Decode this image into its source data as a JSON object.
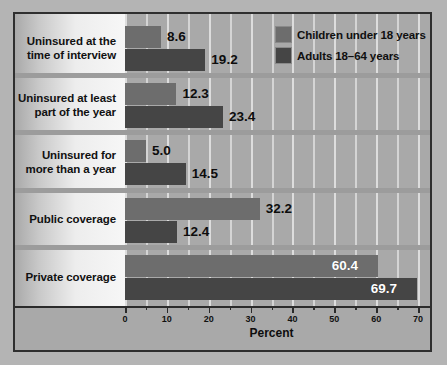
{
  "chart_data": {
    "type": "bar",
    "orientation": "horizontal",
    "title": "",
    "xlabel": "Percent",
    "ylabel": "",
    "xlim": [
      0,
      70
    ],
    "xticks": [
      0,
      10,
      20,
      30,
      40,
      50,
      60,
      70
    ],
    "xtick_labels": [
      "0",
      "10",
      "20",
      "30",
      "40",
      "50",
      "60",
      "70"
    ],
    "minor_tick_step": 5,
    "grid": true,
    "grid_axis": "x",
    "legend_position": "top-right",
    "categories": [
      "Uninsured at the time of interview",
      "Uninsured at least part of the year",
      "Uninsured for more than a year",
      "Public coverage",
      "Private coverage"
    ],
    "series": [
      {
        "name": "Children under 18 years",
        "color": "#6d6d6d",
        "values": [
          8.6,
          12.3,
          5.0,
          32.2,
          60.4
        ],
        "labels": [
          "8.6",
          "12.3",
          "5.0",
          "32.2",
          "60.4"
        ]
      },
      {
        "name": "Adults 18–64 years",
        "color": "#454545",
        "values": [
          19.2,
          23.4,
          14.5,
          12.4,
          69.7
        ],
        "labels": [
          "19.2",
          "23.4",
          "14.5",
          "12.4",
          "69.7"
        ]
      }
    ]
  },
  "categories_display": [
    {
      "line1": "Uninsured at the",
      "line2": "time of interview"
    },
    {
      "line1": "Uninsured at least",
      "line2": "part of the year"
    },
    {
      "line1": "Uninsured for",
      "line2": "more than a year"
    },
    {
      "line1": "Public coverage",
      "line2": ""
    },
    {
      "line1": "Private coverage",
      "line2": ""
    }
  ],
  "legend": {
    "items": [
      {
        "label": "Children under 18 years",
        "color": "#6d6d6d"
      },
      {
        "label": "Adults 18–64 years",
        "color": "#454545"
      }
    ]
  },
  "axis": {
    "title": "Percent",
    "tick_labels": [
      "0",
      "10",
      "20",
      "30",
      "40",
      "50",
      "60",
      "70"
    ]
  },
  "colors": {
    "children_bar": "#6d6d6d",
    "adults_bar": "#454545",
    "plot_background": "#a9a9a9",
    "gridline": "#e6e6e6",
    "frame_border": "#2f2f2f",
    "value_text": "#0d0d0d",
    "value_text_inside": "#ffffff"
  }
}
